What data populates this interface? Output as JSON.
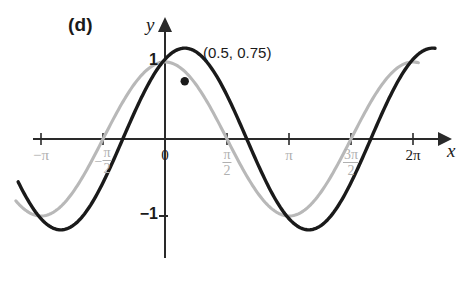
{
  "figure": {
    "panel_label": "(d)",
    "x_axis_label": "x",
    "y_axis_label": "y",
    "annotation": "(0.5, 0.75)"
  },
  "colors": {
    "curve_primary": "#1a1a1a",
    "curve_secondary": "#b8b8b8",
    "axis": "#2a2a2a",
    "tick_label_gray": "#b0b0b0",
    "tick_label_dark": "#1a1a1a",
    "background": "#ffffff"
  },
  "x_ticks": [
    {
      "label": "−π",
      "value": -3.14159,
      "style": "gray",
      "kind": "plain"
    },
    {
      "label": "−π/2",
      "value": -1.5708,
      "style": "gray",
      "kind": "fraction",
      "sign": "−",
      "num": "π",
      "den": "2"
    },
    {
      "label": "0",
      "value": 0,
      "style": "dark",
      "kind": "plain"
    },
    {
      "label": "π/2",
      "value": 1.5708,
      "style": "gray",
      "kind": "fraction",
      "sign": "",
      "num": "π",
      "den": "2"
    },
    {
      "label": "π",
      "value": 3.14159,
      "style": "gray",
      "kind": "plain"
    },
    {
      "label": "3π/2",
      "value": 4.71239,
      "style": "gray",
      "kind": "fraction",
      "sign": "",
      "num": "3π",
      "den": "2"
    },
    {
      "label": "2π",
      "value": 6.28319,
      "style": "dark",
      "kind": "plain"
    }
  ],
  "y_ticks": [
    {
      "label": "1",
      "value": 1
    },
    {
      "label": "−1",
      "value": -1
    }
  ],
  "chart_data": {
    "type": "line",
    "title": "",
    "subtitle": "",
    "xlabel": "x",
    "ylabel": "y",
    "panel": "(d)",
    "xlim": [
      -3.8,
      6.9
    ],
    "ylim": [
      -1.45,
      1.3
    ],
    "grid": false,
    "legend": "none",
    "x_tick_values": [
      -3.14159,
      -1.5708,
      0,
      1.5708,
      3.14159,
      4.71239,
      6.28319
    ],
    "x_tick_labels": [
      "−π",
      "−π/2",
      "0",
      "π/2",
      "π",
      "3π/2",
      "2π"
    ],
    "y_tick_values": [
      1,
      -1
    ],
    "y_tick_labels": [
      "1",
      "−1"
    ],
    "series": [
      {
        "name": "reference cosine",
        "color": "#b8b8b8",
        "style": "solid",
        "formula": "y = cos(x)",
        "amplitude": 1,
        "period": 6.28319,
        "phase": 0,
        "x": [
          -3.8,
          -3.14159,
          -2.5,
          -1.5708,
          -0.8,
          0,
          0.8,
          1.5708,
          2.5,
          3.14159,
          3.8,
          4.71239,
          5.5,
          6.28319
        ],
        "y": [
          -0.79,
          -1,
          -0.8,
          0,
          0.7,
          1,
          0.7,
          0,
          -0.8,
          -1,
          -0.79,
          0,
          0.71,
          1
        ]
      },
      {
        "name": "transformed sine",
        "color": "#1a1a1a",
        "style": "solid",
        "formula": "y = 1.18 sin(x + 1.07)",
        "amplitude": 1.18,
        "period": 6.28319,
        "phase": 1.07,
        "x": [
          -3.8,
          -3.14159,
          -2.64,
          -2.0,
          -1.5708,
          -1.07,
          -0.5,
          0,
          0.5,
          1.0,
          1.5708,
          2.07,
          2.6,
          3.14159,
          3.7,
          4.2,
          4.71239,
          5.2,
          5.7,
          6.28319,
          6.8
        ],
        "y": [
          -0.8,
          -1.04,
          -1.16,
          -1.13,
          -1.0,
          -0.75,
          -0.38,
          0.0,
          0.75,
          1.1,
          1.18,
          1.1,
          0.82,
          0.38,
          -0.12,
          -0.58,
          -0.95,
          -1.14,
          -1.12,
          -0.8,
          -0.3
        ]
      }
    ],
    "annotations": [
      {
        "text": "(0.5, 0.75)",
        "point_x": 0.5,
        "point_y": 0.75,
        "marker": "dot",
        "marker_color": "#1a1a1a"
      }
    ]
  }
}
